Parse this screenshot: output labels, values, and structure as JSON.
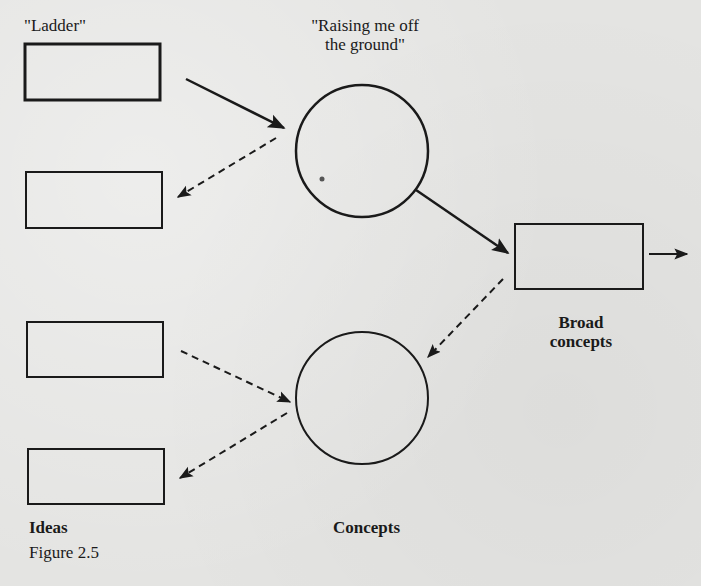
{
  "figure": {
    "caption": "Figure 2.5",
    "background_color": "#e4e4e2",
    "ink_color": "#1a1a1a"
  },
  "labels": {
    "ladder": "\"Ladder\"",
    "raising": "\"Raising me off the ground\"",
    "broad_concepts": "Broad concepts",
    "ideas": "Ideas",
    "concepts": "Concepts"
  },
  "nodes": [
    {
      "id": "box-ladder",
      "shape": "rectangle",
      "label": "\"Ladder\"",
      "style": "thick"
    },
    {
      "id": "box-left-2",
      "shape": "rectangle",
      "label": ""
    },
    {
      "id": "circle-raising",
      "shape": "circle",
      "label": "\"Raising me off the ground\""
    },
    {
      "id": "box-broad-concepts",
      "shape": "rectangle",
      "label": "Broad concepts"
    },
    {
      "id": "box-left-3",
      "shape": "rectangle",
      "label": ""
    },
    {
      "id": "circle-concepts",
      "shape": "circle",
      "label": "Concepts"
    },
    {
      "id": "box-ideas",
      "shape": "rectangle",
      "label": "Ideas"
    }
  ],
  "edges": [
    {
      "from": "box-ladder",
      "to": "circle-raising",
      "style": "solid"
    },
    {
      "from": "circle-raising",
      "to": "box-left-2",
      "style": "dashed"
    },
    {
      "from": "circle-raising",
      "to": "box-broad-concepts",
      "style": "solid"
    },
    {
      "from": "box-broad-concepts",
      "to": "outside-right",
      "style": "solid"
    },
    {
      "from": "box-broad-concepts",
      "to": "circle-concepts",
      "style": "dashed"
    },
    {
      "from": "box-left-3",
      "to": "circle-concepts",
      "style": "dashed"
    },
    {
      "from": "circle-concepts",
      "to": "box-ideas",
      "style": "dashed"
    }
  ]
}
